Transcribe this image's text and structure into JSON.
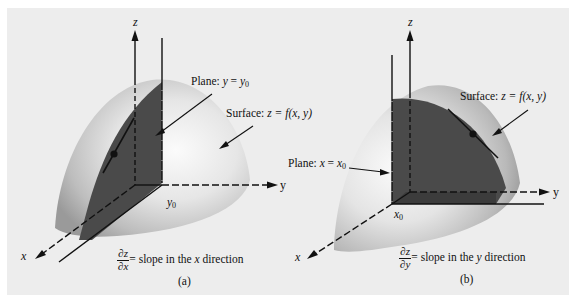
{
  "figure": {
    "background_color": "#ededed",
    "surface_color": "#d9d9d9",
    "plane_color": "#4a4a4a",
    "panels": [
      {
        "id": "a",
        "caption": "(a)",
        "axes": {
          "z": "z",
          "y": "y",
          "x": "x"
        },
        "tick_label": {
          "var": "y",
          "sub": "0"
        },
        "plane_label": {
          "prefix": "Plane: ",
          "lhs": "y",
          "eq": " = ",
          "rhs": "y",
          "rhs_sub": "0"
        },
        "surface_label": {
          "prefix": "Surface: ",
          "expr": "z = f(x, y)"
        },
        "slope_label": {
          "num": "∂z",
          "den": "∂x",
          "text_pre": "= slope in the ",
          "var": "x",
          "text_post": " direction"
        }
      },
      {
        "id": "b",
        "caption": "(b)",
        "axes": {
          "z": "z",
          "y": "y",
          "x": "x"
        },
        "tick_label": {
          "var": "x",
          "sub": "0"
        },
        "plane_label": {
          "prefix": "Plane: ",
          "lhs": "x",
          "eq": " = ",
          "rhs": "x",
          "rhs_sub": "0"
        },
        "surface_label": {
          "prefix": "Surface: ",
          "expr": "z = f(x, y)"
        },
        "slope_label": {
          "num": "∂z",
          "den": "∂y",
          "text_pre": "= slope in the ",
          "var": "y",
          "text_post": " direction"
        }
      }
    ]
  }
}
